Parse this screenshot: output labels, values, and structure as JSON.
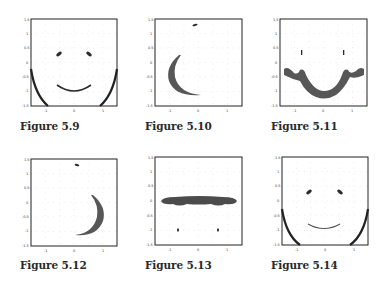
{
  "figures": [
    {
      "caption": "Figure 5.9",
      "content": "full face: two eyes, mouth arc, jaw outline curves"
    },
    {
      "caption": "Figure 5.10",
      "content": "left crescent and small mark at top"
    },
    {
      "caption": "Figure 5.11",
      "content": "wide smile band with two vertical marks"
    },
    {
      "caption": "Figure 5.12",
      "content": "right crescent and small mark at top"
    },
    {
      "caption": "Figure 5.13",
      "content": "horizontal band and two small marks below"
    },
    {
      "caption": "Figure 5.14",
      "content": "full face: two eyes, mouth arc, jaw outline curves"
    }
  ],
  "axes": {
    "xlim": [
      -1.5,
      1.5
    ],
    "ylim": [
      -1.5,
      1.5
    ],
    "x_ticks": [
      "-1",
      "0",
      "1"
    ],
    "y_ticks": [
      "1.5",
      "1",
      "0.5",
      "0",
      "-0.5",
      "-1",
      "-1.5"
    ]
  },
  "colors": {
    "ink": "#2b2b2b",
    "frame": "#222222",
    "grid": "#c8c8c8"
  }
}
